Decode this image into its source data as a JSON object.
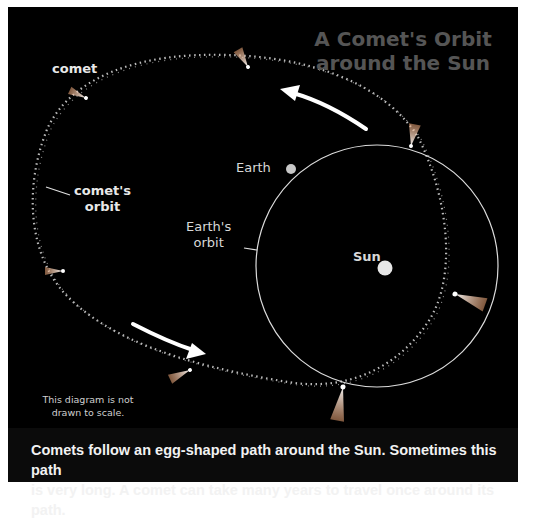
{
  "title": {
    "line1": "A Comet's Orbit",
    "line2": "around the Sun"
  },
  "labels": {
    "comet": "comet",
    "comets_orbit_line1": "comet's",
    "comets_orbit_line2": "orbit",
    "earth": "Earth",
    "earths_orbit_line1": "Earth's",
    "earths_orbit_line2": "orbit",
    "sun": "Sun"
  },
  "note": {
    "line1": "This diagram is not",
    "line2": "drawn to scale."
  },
  "caption": {
    "line1": "Comets follow an egg-shaped path around the Sun.  Sometimes this path",
    "line2": "is very long.  A comet can take many years to travel once around its path."
  },
  "colors": {
    "background": "#000000",
    "title": "#555555",
    "text": "#e8e8e8",
    "sun": "#e6e6e6",
    "orbit": "#dddddd"
  }
}
